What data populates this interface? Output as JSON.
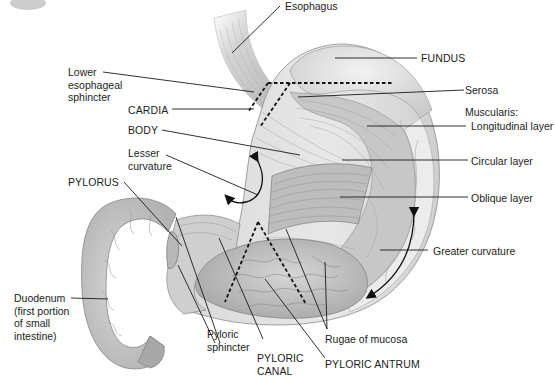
{
  "diagram": {
    "labels": {
      "esophagus": "Esophagus",
      "fundus": "FUNDUS",
      "lower_esophageal_sphincter": "Lower\nesophageal\nsphincter",
      "cardia": "CARDIA",
      "serosa": "Serosa",
      "muscularis": "Muscularis:",
      "longitudinal_layer": "Longitudinal layer",
      "body": "BODY",
      "circular_layer": "Circular layer",
      "lesser_curvature": "Lesser\ncurvature",
      "oblique_layer": "Oblique layer",
      "pylorus": "PYLORUS",
      "greater_curvature": "Greater curvature",
      "duodenum": "Duodenum\n(first portion\nof small\nintestine)",
      "pyloric_sphincter": "Pyloric\nsphincter",
      "pyloric_canal": "PYLORIC\nCANAL",
      "rugae_of_mucosa": "Rugae of mucosa",
      "pyloric_antrum": "PYLORIC ANTRUM"
    },
    "colors": {
      "tissue_light": "#e4e4e4",
      "tissue_mid": "#c4c4c4",
      "tissue_dark": "#9a9a9a",
      "outline": "#6e6e6e",
      "leader_line": "#1a1a1a",
      "background": "#ffffff"
    }
  }
}
